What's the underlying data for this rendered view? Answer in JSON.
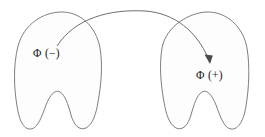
{
  "figure": {
    "title": "",
    "left_region": {
      "label": "Φ (−)",
      "name": "negative-phase-region"
    },
    "right_region": {
      "label": "Φ (+)",
      "name": "positive-phase-region"
    },
    "connector": {
      "kind": "curved-arrow",
      "direction": "left-to-right",
      "from": "Φ (−)",
      "to": "Φ (+)"
    },
    "colors": {
      "background": "#ffffff",
      "outline": "#6f6f6f",
      "fill": "#fdfdfd",
      "arrow": "#5e5e5e",
      "text": "#1a1a1a"
    }
  }
}
